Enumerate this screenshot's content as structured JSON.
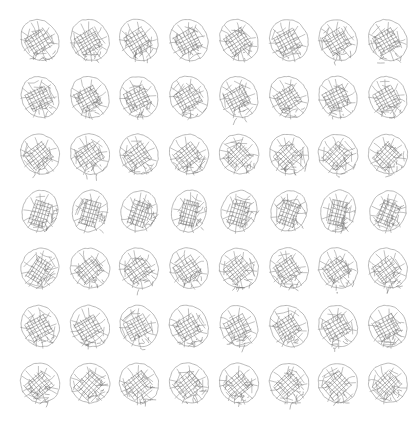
{
  "canvas": {
    "width": 416,
    "height": 426,
    "background_color": "#ffffff",
    "content_type": "generated-sample-grid",
    "description": "Grid of 56 repeated sketch-style oval glyphs, no text or UI chrome"
  },
  "grid": {
    "rows": 7,
    "columns": 8,
    "cell_count": 56,
    "first_column_center_x": 40,
    "column_pitch": 49.7,
    "first_row_center_y": 40,
    "row_pitch": 57.2
  },
  "glyph": {
    "name": "oval-sketch-glyph",
    "nominal_width": 40,
    "nominal_height": 44,
    "outline_color": "#9a9a9a",
    "vein_color": "#8d8d8d",
    "scribble_color": "#6f6f6f",
    "outline_stroke_width": 0.7,
    "vein_stroke_width": 0.55,
    "scribble_stroke_width": 0.5
  },
  "chart_data": {
    "type": "scatter",
    "title": "",
    "xlabel": "",
    "ylabel": "",
    "grid": false,
    "legend": null,
    "categories": [],
    "note": "56-cell sample sheet; each cell holds one stochastic variant of a single oval motif",
    "cells": [
      {
        "row": 0,
        "col": 0,
        "cx": 40,
        "cy": 40,
        "rot": -32,
        "rx": 18.0,
        "ry": 21.5,
        "seed": 101
      },
      {
        "row": 0,
        "col": 1,
        "cx": 90,
        "cy": 40,
        "rot": -30,
        "rx": 18.6,
        "ry": 21.2,
        "seed": 102
      },
      {
        "row": 0,
        "col": 2,
        "cx": 139,
        "cy": 40,
        "rot": -31,
        "rx": 18.3,
        "ry": 21.4,
        "seed": 103
      },
      {
        "row": 0,
        "col": 3,
        "cx": 189,
        "cy": 40,
        "rot": -29,
        "rx": 18.5,
        "ry": 21.0,
        "seed": 104
      },
      {
        "row": 0,
        "col": 4,
        "cx": 239,
        "cy": 40,
        "rot": -33,
        "rx": 18.1,
        "ry": 21.6,
        "seed": 105
      },
      {
        "row": 0,
        "col": 5,
        "cx": 289,
        "cy": 40,
        "rot": -28,
        "rx": 18.8,
        "ry": 21.1,
        "seed": 106
      },
      {
        "row": 0,
        "col": 6,
        "cx": 338,
        "cy": 40,
        "rot": -31,
        "rx": 18.4,
        "ry": 21.3,
        "seed": 107
      },
      {
        "row": 0,
        "col": 7,
        "cx": 388,
        "cy": 40,
        "rot": -30,
        "rx": 18.5,
        "ry": 21.2,
        "seed": 108
      },
      {
        "row": 1,
        "col": 0,
        "cx": 40,
        "cy": 97,
        "rot": -27,
        "rx": 18.2,
        "ry": 21.0,
        "seed": 201
      },
      {
        "row": 1,
        "col": 1,
        "cx": 90,
        "cy": 97,
        "rot": -29,
        "rx": 18.7,
        "ry": 21.3,
        "seed": 202
      },
      {
        "row": 1,
        "col": 2,
        "cx": 139,
        "cy": 97,
        "rot": -26,
        "rx": 18.4,
        "ry": 20.9,
        "seed": 203
      },
      {
        "row": 1,
        "col": 3,
        "cx": 189,
        "cy": 97,
        "rot": -30,
        "rx": 18.6,
        "ry": 21.4,
        "seed": 204
      },
      {
        "row": 1,
        "col": 4,
        "cx": 239,
        "cy": 97,
        "rot": -28,
        "rx": 18.3,
        "ry": 21.1,
        "seed": 205
      },
      {
        "row": 1,
        "col": 5,
        "cx": 289,
        "cy": 97,
        "rot": -31,
        "rx": 18.5,
        "ry": 21.5,
        "seed": 206
      },
      {
        "row": 1,
        "col": 6,
        "cx": 338,
        "cy": 97,
        "rot": -27,
        "rx": 18.8,
        "ry": 21.0,
        "seed": 207
      },
      {
        "row": 1,
        "col": 7,
        "cx": 388,
        "cy": 97,
        "rot": -29,
        "rx": 18.4,
        "ry": 21.2,
        "seed": 208
      },
      {
        "row": 2,
        "col": 0,
        "cx": 40,
        "cy": 154,
        "rot": -38,
        "rx": 18.6,
        "ry": 20.6,
        "seed": 301
      },
      {
        "row": 2,
        "col": 1,
        "cx": 90,
        "cy": 154,
        "rot": -36,
        "rx": 18.9,
        "ry": 20.8,
        "seed": 302
      },
      {
        "row": 2,
        "col": 2,
        "cx": 139,
        "cy": 154,
        "rot": -35,
        "rx": 18.5,
        "ry": 20.7,
        "seed": 303
      },
      {
        "row": 2,
        "col": 3,
        "cx": 189,
        "cy": 154,
        "rot": -37,
        "rx": 18.7,
        "ry": 20.5,
        "seed": 304
      },
      {
        "row": 2,
        "col": 4,
        "cx": 239,
        "cy": 154,
        "rot": -44,
        "rx": 19.2,
        "ry": 20.2,
        "seed": 305
      },
      {
        "row": 2,
        "col": 5,
        "cx": 289,
        "cy": 154,
        "rot": -43,
        "rx": 19.0,
        "ry": 20.3,
        "seed": 306
      },
      {
        "row": 2,
        "col": 6,
        "cx": 338,
        "cy": 154,
        "rot": -45,
        "rx": 19.3,
        "ry": 20.1,
        "seed": 307
      },
      {
        "row": 2,
        "col": 7,
        "cx": 388,
        "cy": 154,
        "rot": -46,
        "rx": 19.1,
        "ry": 20.0,
        "seed": 308
      },
      {
        "row": 3,
        "col": 0,
        "cx": 40,
        "cy": 211,
        "rot": -72,
        "rx": 20.8,
        "ry": 17.6,
        "seed": 401
      },
      {
        "row": 3,
        "col": 1,
        "cx": 90,
        "cy": 211,
        "rot": -74,
        "rx": 21.0,
        "ry": 17.4,
        "seed": 402
      },
      {
        "row": 3,
        "col": 2,
        "cx": 139,
        "cy": 211,
        "rot": -71,
        "rx": 20.6,
        "ry": 17.8,
        "seed": 403
      },
      {
        "row": 3,
        "col": 3,
        "cx": 189,
        "cy": 211,
        "rot": -75,
        "rx": 21.2,
        "ry": 17.3,
        "seed": 404
      },
      {
        "row": 3,
        "col": 4,
        "cx": 239,
        "cy": 211,
        "rot": -73,
        "rx": 20.9,
        "ry": 17.5,
        "seed": 405
      },
      {
        "row": 3,
        "col": 5,
        "cx": 289,
        "cy": 211,
        "rot": -70,
        "rx": 20.5,
        "ry": 17.9,
        "seed": 406
      },
      {
        "row": 3,
        "col": 6,
        "cx": 338,
        "cy": 211,
        "rot": -76,
        "rx": 21.1,
        "ry": 17.2,
        "seed": 407
      },
      {
        "row": 3,
        "col": 7,
        "cx": 388,
        "cy": 211,
        "rot": -68,
        "rx": 20.4,
        "ry": 18.0,
        "seed": 408
      },
      {
        "row": 4,
        "col": 0,
        "cx": 40,
        "cy": 268,
        "rot": -58,
        "rx": 20.0,
        "ry": 18.6,
        "seed": 501
      },
      {
        "row": 4,
        "col": 1,
        "cx": 90,
        "cy": 268,
        "rot": -40,
        "rx": 19.0,
        "ry": 20.2,
        "seed": 502
      },
      {
        "row": 4,
        "col": 2,
        "cx": 139,
        "cy": 268,
        "rot": -36,
        "rx": 18.7,
        "ry": 20.6,
        "seed": 503
      },
      {
        "row": 4,
        "col": 3,
        "cx": 189,
        "cy": 268,
        "rot": -34,
        "rx": 18.6,
        "ry": 20.8,
        "seed": 504
      },
      {
        "row": 4,
        "col": 4,
        "cx": 239,
        "cy": 268,
        "rot": -39,
        "rx": 18.9,
        "ry": 20.4,
        "seed": 505
      },
      {
        "row": 4,
        "col": 5,
        "cx": 289,
        "cy": 268,
        "rot": -33,
        "rx": 18.5,
        "ry": 20.9,
        "seed": 506
      },
      {
        "row": 4,
        "col": 6,
        "cx": 338,
        "cy": 268,
        "rot": -35,
        "rx": 18.8,
        "ry": 20.7,
        "seed": 507
      },
      {
        "row": 4,
        "col": 7,
        "cx": 388,
        "cy": 268,
        "rot": -37,
        "rx": 18.6,
        "ry": 20.5,
        "seed": 508
      },
      {
        "row": 5,
        "col": 0,
        "cx": 40,
        "cy": 326,
        "rot": -29,
        "rx": 18.3,
        "ry": 21.2,
        "seed": 601
      },
      {
        "row": 5,
        "col": 1,
        "cx": 90,
        "cy": 326,
        "rot": -31,
        "rx": 18.6,
        "ry": 21.4,
        "seed": 602
      },
      {
        "row": 5,
        "col": 2,
        "cx": 139,
        "cy": 326,
        "rot": -28,
        "rx": 18.4,
        "ry": 21.1,
        "seed": 603
      },
      {
        "row": 5,
        "col": 3,
        "cx": 189,
        "cy": 326,
        "rot": -30,
        "rx": 18.7,
        "ry": 21.3,
        "seed": 604
      },
      {
        "row": 5,
        "col": 4,
        "cx": 239,
        "cy": 326,
        "rot": -27,
        "rx": 18.2,
        "ry": 21.0,
        "seed": 605
      },
      {
        "row": 5,
        "col": 5,
        "cx": 289,
        "cy": 326,
        "rot": -32,
        "rx": 18.5,
        "ry": 21.5,
        "seed": 606
      },
      {
        "row": 5,
        "col": 6,
        "cx": 338,
        "cy": 326,
        "rot": -30,
        "rx": 18.8,
        "ry": 21.2,
        "seed": 607
      },
      {
        "row": 5,
        "col": 7,
        "cx": 388,
        "cy": 326,
        "rot": -28,
        "rx": 18.4,
        "ry": 21.1,
        "seed": 608
      },
      {
        "row": 6,
        "col": 0,
        "cx": 40,
        "cy": 383,
        "rot": -41,
        "rx": 19.0,
        "ry": 20.4,
        "seed": 701
      },
      {
        "row": 6,
        "col": 1,
        "cx": 90,
        "cy": 383,
        "rot": -47,
        "rx": 19.4,
        "ry": 19.9,
        "seed": 702
      },
      {
        "row": 6,
        "col": 2,
        "cx": 139,
        "cy": 383,
        "rot": -39,
        "rx": 18.9,
        "ry": 20.5,
        "seed": 703
      },
      {
        "row": 6,
        "col": 3,
        "cx": 189,
        "cy": 383,
        "rot": -38,
        "rx": 18.8,
        "ry": 20.6,
        "seed": 704
      },
      {
        "row": 6,
        "col": 4,
        "cx": 239,
        "cy": 383,
        "rot": -40,
        "rx": 19.1,
        "ry": 20.3,
        "seed": 705
      },
      {
        "row": 6,
        "col": 5,
        "cx": 289,
        "cy": 383,
        "rot": -42,
        "rx": 19.2,
        "ry": 20.2,
        "seed": 706
      },
      {
        "row": 6,
        "col": 6,
        "cx": 338,
        "cy": 383,
        "rot": -43,
        "rx": 19.3,
        "ry": 20.1,
        "seed": 707
      },
      {
        "row": 6,
        "col": 7,
        "cx": 388,
        "cy": 383,
        "rot": -44,
        "rx": 19.0,
        "ry": 20.0,
        "seed": 708
      }
    ]
  }
}
